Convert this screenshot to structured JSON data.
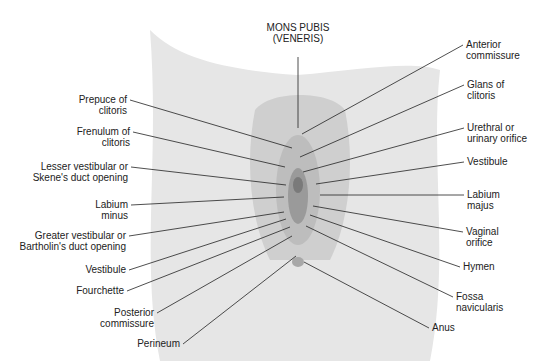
{
  "diagram": {
    "type": "anatomical-illustration",
    "colors": {
      "tissue_light": "#e6e6e6",
      "tissue_mid": "#bdbdbd",
      "tissue_dark": "#7a7a7a",
      "line": "#222222"
    },
    "top_label": "MONS PUBIS\n(VENERIS)",
    "left_labels": [
      {
        "text": "Prepuce of\nclitoris",
        "x": 127,
        "y": 100,
        "tx": 292,
        "ty": 148
      },
      {
        "text": "Frenulum of\nclitoris",
        "x": 130,
        "y": 132,
        "tx": 285,
        "ty": 167
      },
      {
        "text": "Lesser vestibular or\nSkene's duct opening",
        "x": 128,
        "y": 167,
        "tx": 286,
        "ty": 185
      },
      {
        "text": "Labium\nminus",
        "x": 128,
        "y": 205,
        "tx": 284,
        "ty": 197
      },
      {
        "text": "Greater vestibular or\nBartholin's duct opening",
        "x": 126,
        "y": 236,
        "tx": 284,
        "ty": 212
      },
      {
        "text": "Vestibule",
        "x": 126,
        "y": 270,
        "tx": 286,
        "ty": 219
      },
      {
        "text": "Fourchette",
        "x": 124,
        "y": 291,
        "tx": 290,
        "ty": 227
      },
      {
        "text": "Posterior\ncommissure",
        "x": 154,
        "y": 313,
        "tx": 292,
        "ty": 236
      },
      {
        "text": "Perineum",
        "x": 180,
        "y": 344,
        "tx": 296,
        "ty": 256
      }
    ],
    "right_labels": [
      {
        "text": "Anterior\ncommissure",
        "x": 466,
        "y": 45,
        "tx": 302,
        "ty": 134
      },
      {
        "text": "Glans of\nclitoris",
        "x": 467,
        "y": 85,
        "tx": 300,
        "ty": 157
      },
      {
        "text": "Urethral or\nurinary orifice",
        "x": 467,
        "y": 128,
        "tx": 303,
        "ty": 172
      },
      {
        "text": "Vestibule",
        "x": 467,
        "y": 162,
        "tx": 316,
        "ty": 184
      },
      {
        "text": "Labium\nmajus",
        "x": 467,
        "y": 195,
        "tx": 320,
        "ty": 195
      },
      {
        "text": "Vaginal\norifice",
        "x": 466,
        "y": 232,
        "tx": 313,
        "ty": 206
      },
      {
        "text": "Hymen",
        "x": 463,
        "y": 267,
        "tx": 310,
        "ty": 215
      },
      {
        "text": "Fossa\nnavicularis",
        "x": 456,
        "y": 297,
        "tx": 306,
        "ty": 226
      },
      {
        "text": "Anus",
        "x": 432,
        "y": 328,
        "tx": 304,
        "ty": 262
      }
    ]
  }
}
